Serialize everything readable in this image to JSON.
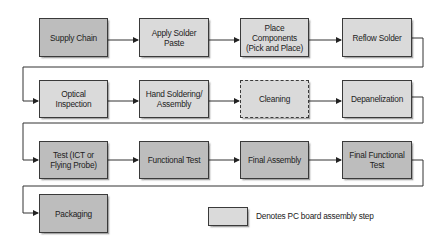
{
  "diagram": {
    "type": "process-flowchart",
    "colors": {
      "dark_box": "#bdbdbd",
      "light_box": "#dadada",
      "stroke": "#3a3a3a"
    },
    "steps": [
      {
        "id": "supply-chain",
        "label": "Supply Chain",
        "style": "dark"
      },
      {
        "id": "apply-solder-paste",
        "label": "Apply Solder\nPaste",
        "style": "light"
      },
      {
        "id": "place-components",
        "label": "Place\nComponents\n(Pick and Place)",
        "style": "light"
      },
      {
        "id": "reflow-solder",
        "label": "Reflow Solder",
        "style": "light"
      },
      {
        "id": "optical-inspection",
        "label": "Optical Inspection",
        "style": "light"
      },
      {
        "id": "hand-soldering",
        "label": "Hand Soldering/\nAssembly",
        "style": "light"
      },
      {
        "id": "cleaning",
        "label": "Cleaning",
        "style": "light-dashed"
      },
      {
        "id": "depanelization",
        "label": "Depanelization",
        "style": "light"
      },
      {
        "id": "test-ict",
        "label": "Test (ICT or\nFlying Probe)",
        "style": "dark"
      },
      {
        "id": "functional-test",
        "label": "Functional Test",
        "style": "dark"
      },
      {
        "id": "final-assembly",
        "label": "Final Assembly",
        "style": "dark"
      },
      {
        "id": "final-functional-test",
        "label": "Final Functional\nTest",
        "style": "dark"
      },
      {
        "id": "packaging",
        "label": "Packaging",
        "style": "dark"
      }
    ],
    "legend": {
      "label": "Denotes PC board assembly step",
      "swatch_style": "light"
    }
  }
}
